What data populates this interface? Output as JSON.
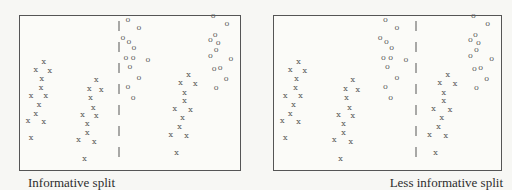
{
  "chart_data": {
    "type": "scatter",
    "coords": "percent of panel box, origin top-left, y increases downward",
    "axes": "none (plain rectangular frame, no ticks, no gridlines)",
    "note": "both panels plot the same 60 points; only the dashed vertical split line position differs",
    "panels": [
      {
        "caption": "Informative split",
        "split_line_x_pct": 44.8
      },
      {
        "caption": "Less informative split",
        "split_line_x_pct": 62.6
      }
    ],
    "series": [
      {
        "name": "x",
        "marker": "x",
        "clusters": [
          [
            [
              10.8,
              29.9
            ],
            [
              7.2,
              35.0
            ],
            [
              13.5,
              35.7
            ],
            [
              9.9,
              40.8
            ],
            [
              9.5,
              46.6
            ],
            [
              5.0,
              51.8
            ],
            [
              11.7,
              51.8
            ],
            [
              8.6,
              57.6
            ],
            [
              7.2,
              63.4
            ],
            [
              3.6,
              67.9
            ],
            [
              10.8,
              68.6
            ],
            [
              5.0,
              79.5
            ]
          ],
          [
            [
              34.7,
              41.5
            ],
            [
              31.5,
              47.3
            ],
            [
              36.9,
              47.9
            ],
            [
              32.0,
              53.1
            ],
            [
              33.3,
              59.5
            ],
            [
              28.4,
              64.1
            ],
            [
              34.7,
              64.7
            ],
            [
              30.6,
              69.9
            ],
            [
              30.6,
              75.7
            ],
            [
              26.6,
              80.8
            ],
            [
              33.8,
              81.5
            ],
            [
              29.3,
              93.1
            ]
          ],
          [
            [
              76.6,
              38.3
            ],
            [
              73.0,
              43.4
            ],
            [
              79.7,
              44.1
            ],
            [
              74.8,
              49.9
            ],
            [
              74.8,
              55.0
            ],
            [
              70.3,
              60.2
            ],
            [
              77.5,
              60.8
            ],
            [
              73.9,
              66.0
            ],
            [
              72.5,
              71.8
            ],
            [
              68.5,
              77.0
            ],
            [
              75.7,
              77.6
            ],
            [
              71.2,
              89.2
            ]
          ]
        ]
      },
      {
        "name": "o",
        "marker": "o",
        "clusters": [
          [
            [
              49.1,
              2.8
            ],
            [
              54.1,
              7.9
            ],
            [
              46.8,
              14.4
            ],
            [
              49.5,
              17.0
            ],
            [
              51.8,
              20.8
            ],
            [
              48.2,
              27.3
            ],
            [
              51.4,
              27.3
            ],
            [
              58.1,
              28.6
            ],
            [
              50.0,
              33.1
            ],
            [
              54.1,
              40.2
            ],
            [
              49.1,
              46.0
            ],
            [
              51.4,
              53.1
            ]
          ],
          [
            [
              87.8,
              0.3
            ],
            [
              94.1,
              5.4
            ],
            [
              88.7,
              12.5
            ],
            [
              86.5,
              15.7
            ],
            [
              90.1,
              17.6
            ],
            [
              89.2,
              22.1
            ],
            [
              86.5,
              26.0
            ],
            [
              95.9,
              27.9
            ],
            [
              91.0,
              33.7
            ],
            [
              88.3,
              34.4
            ],
            [
              93.7,
              40.8
            ],
            [
              89.2,
              46.6
            ]
          ]
        ]
      }
    ],
    "colors": {
      "marker": "#5c5c5c",
      "border": "#555555",
      "bg": "#f7f7f4",
      "panel_bg": "#fbfbf8",
      "caption": "#2d2d2d"
    }
  }
}
